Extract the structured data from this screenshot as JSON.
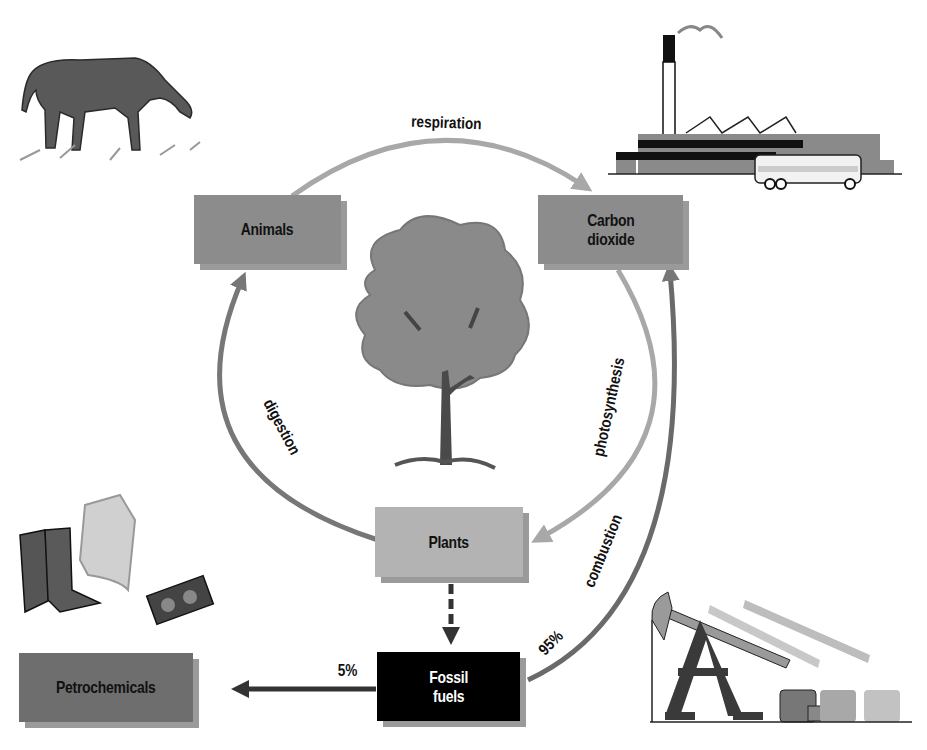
{
  "diagram": {
    "nodes": {
      "animals": {
        "label": "Animals",
        "color": "#8c8c8c"
      },
      "carbon_dioxide": {
        "label": "Carbon\ndioxide",
        "color": "#8c8c8c"
      },
      "plants": {
        "label": "Plants",
        "color": "#b3b3b3"
      },
      "fossil_fuels": {
        "label": "Fossil\nfuels",
        "color": "#000000",
        "text_color": "#ffffff"
      },
      "petrochemicals": {
        "label": "Petrochemicals",
        "color": "#6e6e6e"
      }
    },
    "edges": {
      "respiration": {
        "label": "respiration",
        "from": "Animals",
        "to": "Carbon dioxide"
      },
      "photosynthesis": {
        "label": "photosynthesis",
        "from": "Carbon dioxide",
        "to": "Plants"
      },
      "digestion": {
        "label": "digestion",
        "from": "Plants",
        "to": "Animals"
      },
      "combustion": {
        "label": "combustion",
        "from": "Fossil fuels",
        "to": "Carbon dioxide",
        "share": "95%"
      },
      "fossilization": {
        "label": "",
        "from": "Plants",
        "to": "Fossil fuels",
        "style": "dashed"
      },
      "to_petrochemicals": {
        "label": "",
        "from": "Fossil fuels",
        "to": "Petrochemicals",
        "share": "5%"
      }
    },
    "illustrations": [
      "grazing-horse",
      "factory-with-bus",
      "tree",
      "boots-jacket-cassette",
      "oil-pumpjacks"
    ]
  }
}
